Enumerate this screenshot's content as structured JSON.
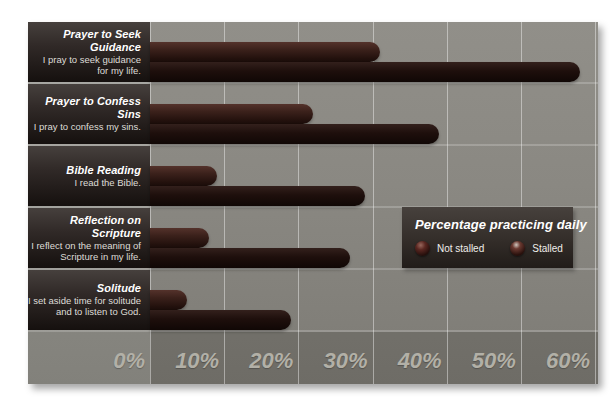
{
  "chart_data": {
    "type": "bar",
    "orientation": "horizontal",
    "title": "Percentage practicing daily",
    "categories": [
      {
        "name": "Prayer to Seek Guidance",
        "desc_lines": [
          "I pray to seek guidance",
          "for my life."
        ]
      },
      {
        "name": "Prayer to Confess Sins",
        "desc_lines": [
          "I pray to confess my sins."
        ]
      },
      {
        "name": "Bible Reading",
        "desc_lines": [
          "I read the Bible."
        ]
      },
      {
        "name": "Reflection on Scripture",
        "desc_lines": [
          "I reflect on the meaning of",
          "Scripture in my life."
        ]
      },
      {
        "name": "Solitude",
        "desc_lines": [
          "I set aside time for solitude",
          "and to listen to God."
        ]
      }
    ],
    "series": [
      {
        "name": "Stalled",
        "bar_position": "top",
        "color": "#3b211b",
        "values": [
          31,
          22,
          9,
          8,
          5
        ]
      },
      {
        "name": "Not stalled",
        "bar_position": "bottom",
        "color": "#1e0f0c",
        "values": [
          58,
          39,
          29,
          27,
          19
        ]
      }
    ],
    "x_ticks": [
      "0%",
      "10%",
      "20%",
      "30%",
      "40%",
      "50%",
      "60%"
    ],
    "x_range": [
      0,
      60
    ],
    "unit": "percent",
    "grid": true,
    "legend": {
      "title": "Percentage practicing daily",
      "position": "middle-right",
      "items": [
        {
          "label": "Not stalled"
        },
        {
          "label": "Stalled"
        }
      ]
    }
  },
  "colors": {
    "page_background": "#ffffff",
    "plot_background": "#8a8882",
    "label_panel": "#2d2623",
    "bar_stalled": "#3b211b",
    "bar_not_stalled": "#1e0f0c",
    "gridline": "#c2c0b8",
    "tick_text": "#b2b0a7",
    "legend_background": "#332d29"
  }
}
